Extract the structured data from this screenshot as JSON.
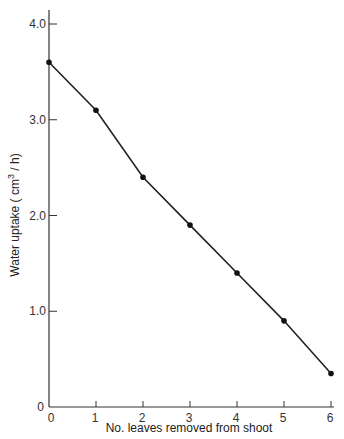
{
  "chart_data": {
    "type": "line",
    "title": "",
    "xlabel": "No. leaves removed from shoot",
    "ylabel": "Water uptake ( cm3 / h)",
    "ylabel_parts": {
      "main": "Water uptake ( cm",
      "sup": "3",
      "tail": " / h)"
    },
    "x": [
      0,
      1,
      2,
      3,
      4,
      5,
      6
    ],
    "series": [
      {
        "name": "Water uptake",
        "values": [
          3.6,
          3.1,
          2.4,
          1.9,
          1.4,
          0.9,
          0.35
        ]
      }
    ],
    "xlim": [
      0,
      6
    ],
    "ylim": [
      0,
      4.0
    ],
    "x_ticks": [
      "0",
      "1",
      "2",
      "3",
      "4",
      "5",
      "6"
    ],
    "y_ticks": [
      "0",
      "1.0",
      "2.0",
      "3.0",
      "4.0"
    ],
    "grid": false,
    "legend": null
  }
}
